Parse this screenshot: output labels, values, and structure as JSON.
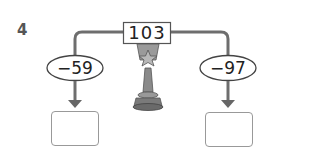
{
  "question": {
    "number": "4"
  },
  "start_value": "103",
  "operations": [
    {
      "label": "−59",
      "answer": ""
    },
    {
      "label": "−97",
      "answer": ""
    }
  ],
  "icons": {
    "center": "trophy-icon"
  },
  "colors": {
    "line": "#6e6e6e",
    "arrow": "#666666",
    "box_border": "#999999",
    "text": "#222222"
  }
}
